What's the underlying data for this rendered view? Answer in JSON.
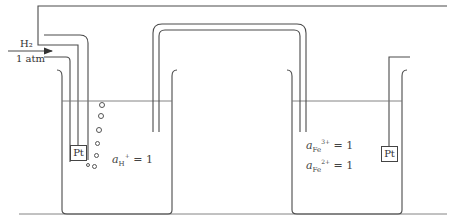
{
  "diagram": {
    "type": "electrochemical-cell",
    "left_half_cell": {
      "name": "standard hydrogen electrode",
      "gas_label": "H₂",
      "pressure_label": "1 atm",
      "electrode_label": "Pt",
      "activity_symbol": "a",
      "activity_subscript": "H",
      "activity_superscript": "+",
      "activity_value": "= 1"
    },
    "right_half_cell": {
      "electrode_label": "Pt",
      "activities": [
        {
          "symbol": "a",
          "subscript": "Fe",
          "superscript": "3+",
          "value": "= 1"
        },
        {
          "symbol": "a",
          "subscript": "Fe",
          "superscript": "2+",
          "value": "= 1"
        }
      ]
    },
    "connections": [
      "external-wire",
      "salt-bridge"
    ],
    "colors": {
      "line": "#4a4a4a",
      "background": "#ffffff"
    }
  }
}
